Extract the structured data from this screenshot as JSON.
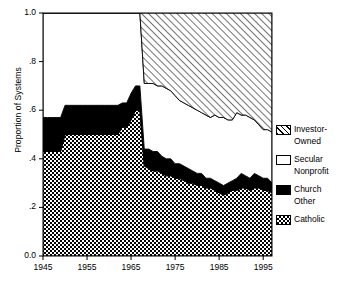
{
  "chart_data": {
    "type": "area",
    "title": "",
    "xlabel": "",
    "ylabel": "Proportion of Systems",
    "xlim": [
      1945,
      1997
    ],
    "ylim": [
      0.0,
      1.0
    ],
    "grid": false,
    "stacked": true,
    "legend_position": "right",
    "ytick_labels": [
      "1.0",
      ".8",
      ".6",
      ".4",
      ".2",
      "0.0"
    ],
    "ytick_values": [
      1.0,
      0.8,
      0.6,
      0.4,
      0.2,
      0.0
    ],
    "xtick_labels": [
      "1945",
      "1955",
      "1965",
      "1975",
      "1985",
      "1995"
    ],
    "xtick_values": [
      1945,
      1955,
      1965,
      1975,
      1985,
      1995
    ],
    "series": [
      {
        "name": "Catholic",
        "pattern": "checkerboard",
        "color": "#808080",
        "values": [
          0.43,
          0.43,
          0.43,
          0.43,
          0.43,
          0.5,
          0.5,
          0.5,
          0.5,
          0.5,
          0.5,
          0.5,
          0.5,
          0.5,
          0.5,
          0.5,
          0.5,
          0.5,
          0.53,
          0.53,
          0.56,
          0.6,
          0.6,
          0.37,
          0.36,
          0.35,
          0.35,
          0.34,
          0.33,
          0.33,
          0.32,
          0.32,
          0.31,
          0.3,
          0.3,
          0.29,
          0.29,
          0.28,
          0.28,
          0.27,
          0.26,
          0.25,
          0.26,
          0.27,
          0.27,
          0.28,
          0.28,
          0.27,
          0.28,
          0.28,
          0.27,
          0.27,
          0.26
        ]
      },
      {
        "name": "Church Other",
        "pattern": "solid-black",
        "color": "#000000",
        "values": [
          0.14,
          0.14,
          0.14,
          0.14,
          0.14,
          0.12,
          0.12,
          0.12,
          0.12,
          0.12,
          0.12,
          0.12,
          0.12,
          0.12,
          0.12,
          0.12,
          0.12,
          0.12,
          0.1,
          0.1,
          0.11,
          0.1,
          0.1,
          0.07,
          0.08,
          0.08,
          0.08,
          0.07,
          0.07,
          0.07,
          0.06,
          0.06,
          0.06,
          0.06,
          0.05,
          0.05,
          0.05,
          0.04,
          0.04,
          0.04,
          0.04,
          0.04,
          0.04,
          0.04,
          0.05,
          0.06,
          0.05,
          0.05,
          0.06,
          0.05,
          0.05,
          0.05,
          0.04
        ]
      },
      {
        "name": "Secular Nonprofit",
        "pattern": "white",
        "color": "#ffffff",
        "values": [
          0.43,
          0.43,
          0.43,
          0.43,
          0.43,
          0.38,
          0.38,
          0.38,
          0.38,
          0.38,
          0.38,
          0.38,
          0.38,
          0.38,
          0.38,
          0.38,
          0.38,
          0.38,
          0.37,
          0.37,
          0.33,
          0.3,
          0.3,
          0.27,
          0.27,
          0.28,
          0.27,
          0.29,
          0.29,
          0.28,
          0.28,
          0.26,
          0.26,
          0.26,
          0.26,
          0.26,
          0.25,
          0.26,
          0.25,
          0.27,
          0.27,
          0.28,
          0.26,
          0.25,
          0.27,
          0.24,
          0.25,
          0.25,
          0.22,
          0.21,
          0.2,
          0.2,
          0.21
        ]
      },
      {
        "name": "Investor-Owned",
        "pattern": "diagonal-hatch",
        "color": "#ffffff",
        "values": [
          0.0,
          0.0,
          0.0,
          0.0,
          0.0,
          0.0,
          0.0,
          0.0,
          0.0,
          0.0,
          0.0,
          0.0,
          0.0,
          0.0,
          0.0,
          0.0,
          0.0,
          0.0,
          0.0,
          0.0,
          0.0,
          0.0,
          0.0,
          0.29,
          0.29,
          0.29,
          0.3,
          0.3,
          0.31,
          0.32,
          0.34,
          0.36,
          0.37,
          0.38,
          0.39,
          0.4,
          0.41,
          0.42,
          0.43,
          0.42,
          0.43,
          0.43,
          0.44,
          0.44,
          0.41,
          0.42,
          0.42,
          0.43,
          0.44,
          0.46,
          0.48,
          0.48,
          0.49
        ]
      }
    ]
  },
  "legend": {
    "items": [
      {
        "label_line1": "Investor-",
        "label_line2": "Owned",
        "pattern": "diagonal-hatch"
      },
      {
        "label_line1": "Secular",
        "label_line2": "Nonprofit",
        "pattern": "white"
      },
      {
        "label_line1": "Church",
        "label_line2": "Other",
        "pattern": "solid-black"
      },
      {
        "label_line1": "Catholic",
        "label_line2": "",
        "pattern": "checkerboard"
      }
    ]
  },
  "axes": {
    "y_title": "Proportion of Systems",
    "y_ticks": [
      "1.0",
      ".8",
      ".6",
      ".4",
      ".2",
      "0.0"
    ],
    "x_ticks": [
      "1945",
      "1955",
      "1965",
      "1975",
      "1985",
      "1995"
    ]
  }
}
